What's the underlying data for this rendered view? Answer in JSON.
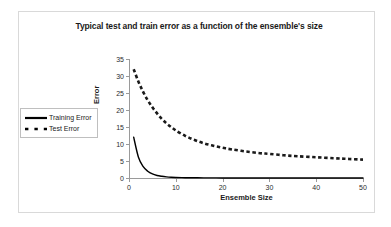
{
  "chart_data": {
    "type": "line",
    "title": "Typical test and train error as a function of the ensemble's size",
    "xlabel": "Ensemble Size",
    "ylabel": "Error",
    "xlim": [
      0,
      50
    ],
    "ylim": [
      0,
      35
    ],
    "xticks": [
      0,
      10,
      20,
      30,
      40,
      50
    ],
    "yticks": [
      0,
      5,
      10,
      15,
      20,
      25,
      30,
      35
    ],
    "grid": false,
    "legend_position": "left-outside",
    "x": [
      1,
      2,
      3,
      4,
      5,
      6,
      7,
      8,
      9,
      10,
      12,
      14,
      16,
      18,
      20,
      22,
      25,
      28,
      30,
      33,
      36,
      40,
      44,
      47,
      50
    ],
    "series": [
      {
        "name": "Training Error",
        "style": "solid",
        "color": "#000000",
        "values": [
          12.0,
          6.2,
          3.4,
          2.0,
          1.2,
          0.75,
          0.5,
          0.33,
          0.22,
          0.16,
          0.09,
          0.06,
          0.04,
          0.03,
          0.02,
          0.02,
          0.01,
          0.01,
          0.01,
          0.0,
          0.0,
          0.0,
          0.0,
          0.0,
          0.0
        ]
      },
      {
        "name": "Test Error",
        "style": "dashed",
        "color": "#1a1a1a",
        "values": [
          32.0,
          28.4,
          25.4,
          22.9,
          20.8,
          19.0,
          17.4,
          16.1,
          15.0,
          14.0,
          12.4,
          11.2,
          10.2,
          9.5,
          8.9,
          8.4,
          7.8,
          7.3,
          7.1,
          6.7,
          6.4,
          6.1,
          5.8,
          5.6,
          5.4
        ]
      }
    ]
  },
  "legend": {
    "items": [
      {
        "label": "Training Error",
        "style": "solid"
      },
      {
        "label": "Test Error",
        "style": "dashed"
      }
    ]
  }
}
